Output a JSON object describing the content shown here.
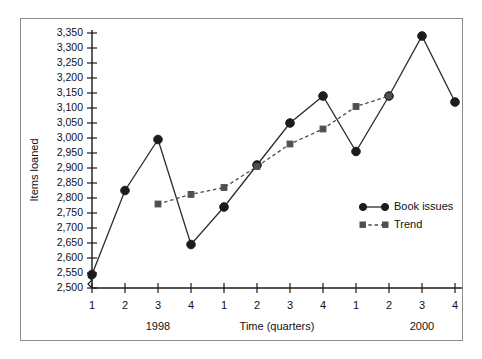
{
  "chart_data": {
    "type": "line",
    "title": "",
    "xlabel": "Time (quarters)",
    "ylabel": "Items loaned",
    "categories": [
      "1",
      "2",
      "3",
      "4",
      "1",
      "2",
      "3",
      "4",
      "1",
      "2",
      "3",
      "4"
    ],
    "group_labels": [
      "1998",
      "2000"
    ],
    "ylim": [
      2500,
      3350
    ],
    "ytick_step": 50,
    "ytick_labels": [
      "3,350",
      "3,300",
      "3,250",
      "3,200",
      "3,150",
      "3,100",
      "3,050",
      "3,000",
      "2,950",
      "2,900",
      "2,850",
      "2,800",
      "2,750",
      "2,700",
      "2,650",
      "2,600",
      "2,550",
      "2,500"
    ],
    "ytick_values": [
      3350,
      3300,
      3250,
      3200,
      3150,
      3100,
      3050,
      3000,
      2950,
      2900,
      2850,
      2800,
      2750,
      2700,
      2650,
      2600,
      2550,
      2500
    ],
    "axis_break": true,
    "grid": false,
    "legend_position": "inside-right",
    "series": [
      {
        "name": "Book issues",
        "marker": "circle",
        "line": "solid",
        "color": "#1c1c1c",
        "values": [
          2545,
          2825,
          2995,
          2645,
          2770,
          2910,
          3050,
          3140,
          2955,
          3140,
          3340,
          3120
        ]
      },
      {
        "name": "Trend",
        "marker": "square",
        "line": "dashed",
        "color": "#4f4f4f",
        "values": [
          null,
          null,
          2780,
          2812,
          2835,
          2905,
          2980,
          3030,
          3105,
          3140,
          null,
          null
        ]
      }
    ]
  },
  "legend": {
    "entries": [
      {
        "label": "Book issues"
      },
      {
        "label": "Trend"
      }
    ]
  },
  "colors": {
    "book_issues": "#1c1c1c",
    "trend": "#4f4f4f",
    "frame": "#8d8d8d",
    "axis": "#1a1a1a",
    "background": "#ffffff"
  }
}
